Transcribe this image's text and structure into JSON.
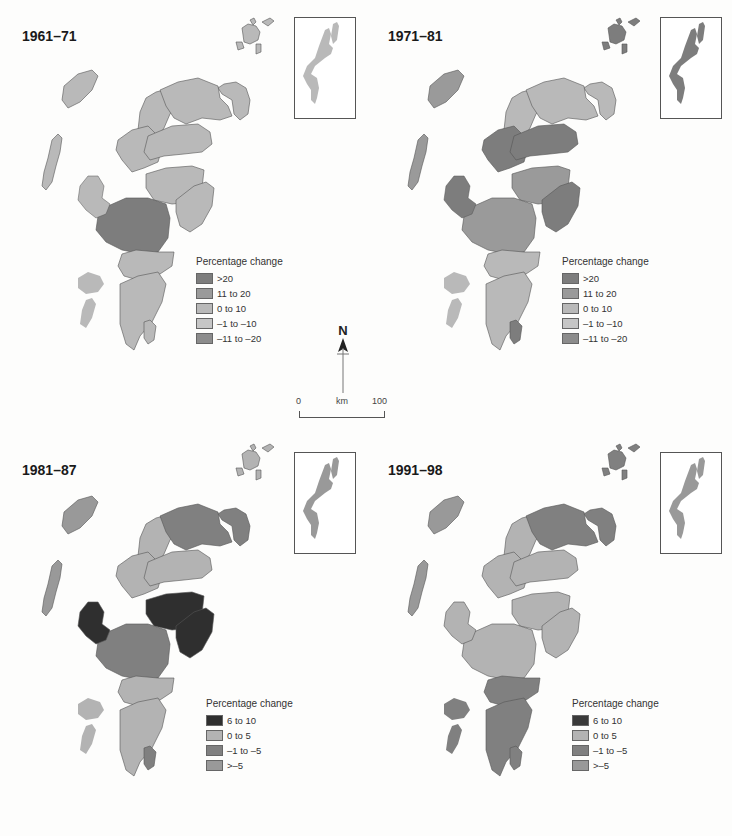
{
  "figure": {
    "panels": [
      {
        "title": "1961–71",
        "legend": {
          "title": "Percentage change",
          "items": [
            {
              "label": ">20",
              "color": "#7d7d7d"
            },
            {
              "label": "11 to 20",
              "color": "#9a9a9a"
            },
            {
              "label": "0 to 10",
              "color": "#b9b9b9"
            },
            {
              "label": "–1 to –10",
              "color": "#c6c6c6"
            },
            {
              "label": "–11 to –20",
              "color": "#8c8c8c"
            }
          ]
        },
        "regions": {
          "north_east": "#b9b9b9",
          "north_west": "#b9b9b9",
          "north_central": "#b9b9b9",
          "highland_central": "#b9b9b9",
          "moray": "#b9b9b9",
          "east_mid": "#b9b9b9",
          "east_coast": "#b9b9b9",
          "west_central": "#7d7d7d",
          "south_west": "#b9b9b9",
          "south": "#b9b9b9",
          "islands_west": "#b9b9b9",
          "orkney": "#b9b9b9",
          "shetland": "#b9b9b9",
          "arran": "#b9b9b9"
        }
      },
      {
        "title": "1971–81",
        "legend": {
          "title": "Percentage change",
          "items": [
            {
              "label": ">20",
              "color": "#7d7d7d"
            },
            {
              "label": "11 to 20",
              "color": "#9a9a9a"
            },
            {
              "label": "0 to 10",
              "color": "#b9b9b9"
            },
            {
              "label": "–1 to –10",
              "color": "#c6c6c6"
            },
            {
              "label": "–11 to –20",
              "color": "#8c8c8c"
            }
          ]
        },
        "regions": {
          "north_east": "#b9b9b9",
          "north_west": "#b9b9b9",
          "north_central": "#b9b9b9",
          "highland_central": "#7d7d7d",
          "moray": "#7d7d7d",
          "east_mid": "#9a9a9a",
          "east_coast": "#7d7d7d",
          "west_central": "#9a9a9a",
          "south_west": "#b9b9b9",
          "south": "#b9b9b9",
          "islands_west": "#9a9a9a",
          "orkney": "#7d7d7d",
          "shetland": "#7d7d7d",
          "arran": "#7d7d7d"
        }
      },
      {
        "title": "1981–87",
        "legend": {
          "title": "Percentage change",
          "items": [
            {
              "label": "6 to 10",
              "color": "#2f2f2f"
            },
            {
              "label": "0 to 5",
              "color": "#b3b3b3"
            },
            {
              "label": "–1 to –5",
              "color": "#808080"
            },
            {
              "label": ">–5",
              "color": "#999999"
            }
          ]
        },
        "regions": {
          "north_east": "#808080",
          "north_west": "#b3b3b3",
          "north_central": "#808080",
          "highland_central": "#b3b3b3",
          "moray": "#b3b3b3",
          "east_mid": "#2f2f2f",
          "east_coast": "#2f2f2f",
          "west_central": "#808080",
          "south_west": "#b3b3b3",
          "south": "#b3b3b3",
          "islands_west": "#999999",
          "orkney": "#b3b3b3",
          "shetland": "#999999",
          "arran": "#808080",
          "skye": "#2f2f2f"
        }
      },
      {
        "title": "1991–98",
        "legend": {
          "title": "Percentage change",
          "items": [
            {
              "label": "6 to 10",
              "color": "#3a3a3a"
            },
            {
              "label": "0 to 5",
              "color": "#b3b3b3"
            },
            {
              "label": "–1 to –5",
              "color": "#808080"
            },
            {
              "label": ">–5",
              "color": "#999999"
            }
          ]
        },
        "regions": {
          "north_east": "#808080",
          "north_west": "#b3b3b3",
          "north_central": "#808080",
          "highland_central": "#b3b3b3",
          "moray": "#b3b3b3",
          "east_mid": "#b3b3b3",
          "east_coast": "#b3b3b3",
          "west_central": "#b3b3b3",
          "south_west": "#808080",
          "south": "#808080",
          "islands_west": "#999999",
          "orkney": "#808080",
          "shetland": "#999999",
          "arran": "#808080",
          "skye": "#b3b3b3"
        }
      }
    ],
    "north_arrow": {
      "label": "N"
    },
    "scale_bar": {
      "start": "0",
      "unit": "km",
      "end": "100"
    }
  }
}
